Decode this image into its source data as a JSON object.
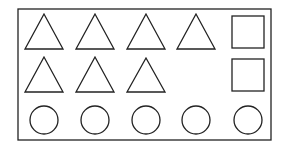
{
  "diagram": {
    "stroke_color": "#222222",
    "background": "#ffffff",
    "frame": {
      "x": 18,
      "y": 9,
      "width": 253,
      "height": 131
    },
    "triangles": [
      {
        "row": 1,
        "cx": 44,
        "top": 14,
        "bottom": 49,
        "half_width": 19
      },
      {
        "row": 1,
        "cx": 95,
        "top": 14,
        "bottom": 49,
        "half_width": 19
      },
      {
        "row": 1,
        "cx": 146,
        "top": 14,
        "bottom": 49,
        "half_width": 19
      },
      {
        "row": 1,
        "cx": 196,
        "top": 14,
        "bottom": 49,
        "half_width": 19
      },
      {
        "row": 2,
        "cx": 44,
        "top": 57,
        "bottom": 92,
        "half_width": 19
      },
      {
        "row": 2,
        "cx": 95,
        "top": 57,
        "bottom": 92,
        "half_width": 19
      },
      {
        "row": 2,
        "cx": 146,
        "top": 58,
        "bottom": 92,
        "half_width": 19
      }
    ],
    "squares": [
      {
        "x": 232,
        "y": 16,
        "size": 32
      },
      {
        "x": 232,
        "y": 59,
        "size": 32
      }
    ],
    "circles": [
      {
        "cx": 44,
        "cy": 120,
        "r": 14
      },
      {
        "cx": 95,
        "cy": 120,
        "r": 14
      },
      {
        "cx": 146,
        "cy": 120,
        "r": 14
      },
      {
        "cx": 196,
        "cy": 120,
        "r": 14
      },
      {
        "cx": 248,
        "cy": 120,
        "r": 14
      }
    ],
    "counts": {
      "triangles": 7,
      "squares": 2,
      "circles": 5
    }
  }
}
